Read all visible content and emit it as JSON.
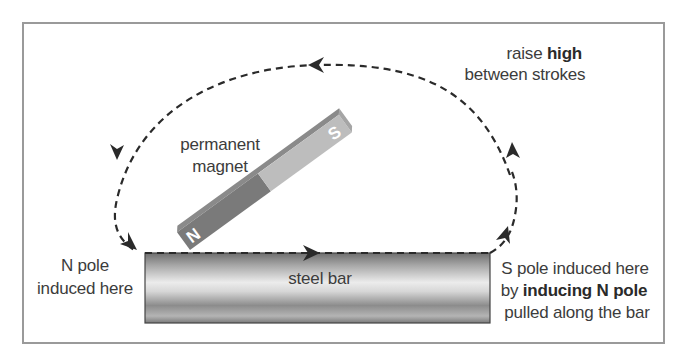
{
  "diagram": {
    "type": "magnetisation-by-stroking",
    "colors": {
      "frame": "#9a9a9a",
      "path": "#2a2a2a",
      "magnet_north": "#7a7a7a",
      "magnet_south": "#bdbdbd",
      "bar_dark": "#6e6e6e",
      "bar_light": "#e6e6e6",
      "text": "#3c3c3c"
    },
    "labels": {
      "raise_prefix": "raise ",
      "raise_bold": "high",
      "raise_line2": "between strokes",
      "magnet_line1": "permanent",
      "magnet_line2": "magnet",
      "magnet_north_letter": "N",
      "magnet_south_letter": "S",
      "bar": "steel bar",
      "n_pole_line1": "N pole",
      "n_pole_line2": "induced here",
      "s_pole_line1": "S pole induced here",
      "s_pole_line2_prefix": "by ",
      "s_pole_line2_bold": "inducing N pole",
      "s_pole_line3": "pulled along the bar"
    },
    "arrows": [
      {
        "name": "top-arrow",
        "direction": "left"
      },
      {
        "name": "left-upper-arrow",
        "direction": "down"
      },
      {
        "name": "left-lower-arrow",
        "direction": "down-right"
      },
      {
        "name": "bar-arrow",
        "direction": "right"
      },
      {
        "name": "right-lower-arrow",
        "direction": "up"
      },
      {
        "name": "right-upper-arrow",
        "direction": "up"
      }
    ]
  }
}
